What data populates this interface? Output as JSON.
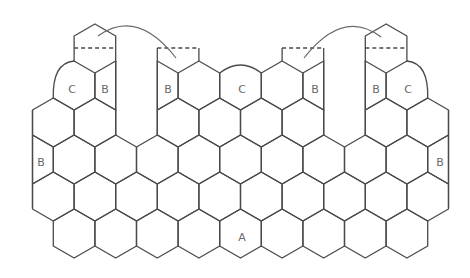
{
  "diagram": {
    "title": "",
    "stroke_color": "#4a4a4a",
    "label_color": "#6a6a6a",
    "background": "#ffffff",
    "geometry": {
      "x_origin": 32.5,
      "half_width": 20.8,
      "top_offset": 12,
      "side_length": 25,
      "row_tops": [
        24,
        61,
        98,
        135,
        172,
        209
      ]
    },
    "labels": [
      {
        "text": "C",
        "x": 72,
        "y": 89
      },
      {
        "text": "B",
        "x": 105,
        "y": 89
      },
      {
        "text": "B",
        "x": 168,
        "y": 89
      },
      {
        "text": "C",
        "x": 242,
        "y": 89
      },
      {
        "text": "B",
        "x": 315,
        "y": 89
      },
      {
        "text": "B",
        "x": 376,
        "y": 89
      },
      {
        "text": "C",
        "x": 408,
        "y": 89
      },
      {
        "text": "B",
        "x": 41,
        "y": 162
      },
      {
        "text": "B",
        "x": 440,
        "y": 162
      },
      {
        "text": "A",
        "x": 242,
        "y": 237
      }
    ],
    "rows": [
      {
        "row": 0,
        "cells": [
          {
            "n": 3,
            "type": "flap"
          },
          {
            "n": 17,
            "type": "flap"
          }
        ]
      },
      {
        "row": 1,
        "cells": [
          {
            "n": 2,
            "type": "C-left"
          },
          {
            "n": 4,
            "type": "B-lefthalf"
          },
          {
            "n": 6,
            "type": "B-righthalf"
          },
          {
            "n": 8,
            "type": "full"
          },
          {
            "n": 10,
            "type": "C-top"
          },
          {
            "n": 12,
            "type": "full"
          },
          {
            "n": 14,
            "type": "B-lefthalf"
          },
          {
            "n": 16,
            "type": "B-righthalf"
          },
          {
            "n": 18,
            "type": "C-right"
          }
        ]
      },
      {
        "row": 2,
        "cells": [
          {
            "n": 1,
            "type": "full"
          },
          {
            "n": 3,
            "type": "full"
          },
          {
            "n": 7,
            "type": "full"
          },
          {
            "n": 9,
            "type": "full"
          },
          {
            "n": 11,
            "type": "full"
          },
          {
            "n": 13,
            "type": "full"
          },
          {
            "n": 17,
            "type": "full"
          },
          {
            "n": 19,
            "type": "full"
          }
        ]
      },
      {
        "row": 3,
        "cells": [
          {
            "n": 0,
            "type": "B-righthalf"
          },
          {
            "n": 2,
            "type": "full"
          },
          {
            "n": 4,
            "type": "full"
          },
          {
            "n": 6,
            "type": "full"
          },
          {
            "n": 8,
            "type": "full"
          },
          {
            "n": 10,
            "type": "full"
          },
          {
            "n": 12,
            "type": "full"
          },
          {
            "n": 14,
            "type": "full"
          },
          {
            "n": 16,
            "type": "full"
          },
          {
            "n": 18,
            "type": "full"
          },
          {
            "n": 20,
            "type": "B-lefthalf"
          }
        ]
      },
      {
        "row": 4,
        "cells": [
          {
            "n": 1,
            "type": "full"
          },
          {
            "n": 3,
            "type": "full"
          },
          {
            "n": 5,
            "type": "full"
          },
          {
            "n": 7,
            "type": "full"
          },
          {
            "n": 9,
            "type": "full"
          },
          {
            "n": 11,
            "type": "full"
          },
          {
            "n": 13,
            "type": "full"
          },
          {
            "n": 15,
            "type": "full"
          },
          {
            "n": 17,
            "type": "full"
          },
          {
            "n": 19,
            "type": "full"
          }
        ]
      },
      {
        "row": 5,
        "cells": [
          {
            "n": 2,
            "type": "full"
          },
          {
            "n": 4,
            "type": "full"
          },
          {
            "n": 6,
            "type": "full"
          },
          {
            "n": 8,
            "type": "full"
          },
          {
            "n": 10,
            "type": "full"
          },
          {
            "n": 12,
            "type": "full"
          },
          {
            "n": 14,
            "type": "full"
          },
          {
            "n": 16,
            "type": "full"
          },
          {
            "n": 18,
            "type": "full"
          }
        ]
      }
    ],
    "fold_flaps": [
      {
        "n_from": 6,
        "n_to": 8,
        "dash_y": 48,
        "bottom_y": 61
      },
      {
        "n_from": 12,
        "n_to": 14,
        "dash_y": 48,
        "bottom_y": 61
      }
    ],
    "fold_arrows": [
      {
        "from": [
          98,
          36
        ],
        "control": [
          137,
          8
        ],
        "to": [
          176,
          58
        ]
      },
      {
        "from": [
          304,
          58
        ],
        "control": [
          343,
          8
        ],
        "to": [
          381,
          37
        ]
      }
    ],
    "legend": {
      "A": "full hexagon",
      "B": "half hexagon",
      "C": "curved edge hexagon"
    }
  }
}
